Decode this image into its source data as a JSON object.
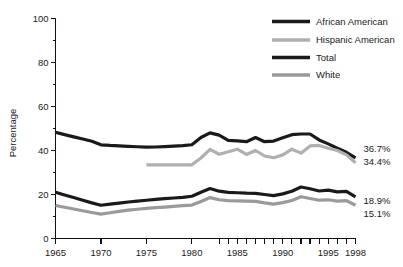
{
  "chart_data": {
    "type": "line",
    "title": "",
    "xlabel": "",
    "ylabel": "Percentage",
    "ylim": [
      0,
      100
    ],
    "xlim": [
      1965,
      1998
    ],
    "grid": false,
    "legend_position": "top-right",
    "y_ticks_major": [
      0,
      20,
      40,
      60,
      80,
      100
    ],
    "y_ticks_minor": [
      10,
      30,
      50,
      70,
      90
    ],
    "y_tick_labels": [
      "0",
      "20",
      "40",
      "60",
      "80",
      "100"
    ],
    "x_tick_labels": [
      "1965",
      "1970",
      "1975",
      "1980",
      "1985",
      "1990",
      "1995",
      "1998"
    ],
    "x_tick_label_values": [
      1965,
      1970,
      1975,
      1980,
      1985,
      1990,
      1995,
      1998
    ],
    "x_ticks_all": [
      1965,
      1970,
      1975,
      1980,
      1983,
      1984,
      1985,
      1986,
      1987,
      1988,
      1989,
      1990,
      1991,
      1992,
      1993,
      1994,
      1995,
      1996,
      1997,
      1998
    ],
    "series": [
      {
        "name": "African American",
        "color": "#1a1a1a",
        "width": 3.2,
        "x": [
          1965,
          1966,
          1967,
          1968,
          1969,
          1970,
          1971,
          1972,
          1973,
          1974,
          1975,
          1976,
          1977,
          1978,
          1979,
          1980,
          1981,
          1982,
          1983,
          1984,
          1985,
          1986,
          1987,
          1988,
          1989,
          1990,
          1991,
          1992,
          1993,
          1994,
          1995,
          1996,
          1997,
          1998
        ],
        "values": [
          48.3,
          47.2,
          46.2,
          45.2,
          44.2,
          42.6,
          42.3,
          42.1,
          41.9,
          41.7,
          41.5,
          41.6,
          41.8,
          42.0,
          42.2,
          42.6,
          45.9,
          48.0,
          47.0,
          44.6,
          44.4,
          44.0,
          45.9,
          44.0,
          44.3,
          45.8,
          47.2,
          47.5,
          47.5,
          44.8,
          43.0,
          41.0,
          39.2,
          36.7
        ],
        "end_label": "36.7%"
      },
      {
        "name": "Hispanic American",
        "color": "#b0b0b0",
        "width": 3.2,
        "x": [
          1975,
          1976,
          1977,
          1978,
          1979,
          1980,
          1981,
          1982,
          1983,
          1984,
          1985,
          1986,
          1987,
          1988,
          1989,
          1990,
          1991,
          1992,
          1993,
          1994,
          1995,
          1996,
          1997,
          1998
        ],
        "values": [
          33.5,
          33.5,
          33.5,
          33.5,
          33.5,
          33.5,
          36.6,
          40.5,
          38.3,
          39.4,
          40.6,
          38.2,
          40.0,
          37.5,
          36.7,
          38.0,
          40.6,
          38.8,
          42.1,
          42.3,
          41.0,
          40.0,
          38.0,
          34.4
        ],
        "end_label": "34.4%"
      },
      {
        "name": "Total",
        "color": "#1a1a1a",
        "width": 3.2,
        "x": [
          1965,
          1966,
          1967,
          1968,
          1969,
          1970,
          1971,
          1972,
          1973,
          1974,
          1975,
          1976,
          1977,
          1978,
          1979,
          1980,
          1981,
          1982,
          1983,
          1984,
          1985,
          1986,
          1987,
          1988,
          1989,
          1990,
          1991,
          1992,
          1993,
          1994,
          1995,
          1996,
          1997,
          1998
        ],
        "values": [
          21.0,
          19.8,
          18.6,
          17.4,
          16.2,
          15.1,
          15.6,
          16.1,
          16.6,
          17.0,
          17.4,
          17.8,
          18.1,
          18.4,
          18.7,
          19.2,
          21.0,
          22.7,
          21.5,
          21.0,
          20.8,
          20.6,
          20.5,
          20.0,
          19.5,
          20.3,
          21.5,
          23.4,
          22.6,
          21.6,
          22.0,
          21.2,
          21.4,
          18.9
        ],
        "end_label": "18.9%"
      },
      {
        "name": "White",
        "color": "#9a9a9a",
        "width": 3.2,
        "x": [
          1965,
          1966,
          1967,
          1968,
          1969,
          1970,
          1971,
          1972,
          1973,
          1974,
          1975,
          1976,
          1977,
          1978,
          1979,
          1980,
          1981,
          1982,
          1983,
          1984,
          1985,
          1986,
          1987,
          1988,
          1989,
          1990,
          1991,
          1992,
          1993,
          1994,
          1995,
          1996,
          1997,
          1998
        ],
        "values": [
          15.0,
          14.2,
          13.4,
          12.6,
          11.8,
          11.1,
          11.7,
          12.3,
          12.9,
          13.3,
          13.7,
          14.0,
          14.3,
          14.6,
          14.9,
          15.2,
          16.8,
          18.6,
          17.6,
          17.2,
          17.1,
          17.0,
          16.9,
          16.2,
          15.6,
          16.3,
          17.3,
          19.0,
          18.2,
          17.4,
          17.6,
          17.0,
          17.2,
          15.1
        ],
        "end_label": "15.1%"
      }
    ],
    "end_labels": [
      {
        "text": "36.7%",
        "value": 36.7
      },
      {
        "text": "34.4%",
        "value": 34.4
      },
      {
        "text": "18.9%",
        "value": 18.9
      },
      {
        "text": "15.1%",
        "value": 15.1
      }
    ],
    "legend": [
      {
        "label": "African American",
        "color": "#1a1a1a"
      },
      {
        "label": "Hispanic American",
        "color": "#b0b0b0"
      },
      {
        "label": "Total",
        "color": "#1a1a1a"
      },
      {
        "label": "White",
        "color": "#9a9a9a"
      }
    ]
  }
}
